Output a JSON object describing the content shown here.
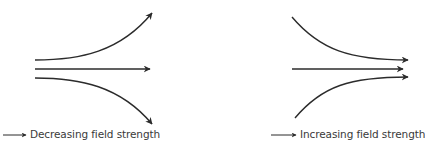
{
  "diagrams": [
    {
      "name": "diverging-field-lines",
      "legend_label": "Decreasing field strength",
      "line_color": "#2b2b2b"
    },
    {
      "name": "converging-field-lines",
      "legend_label": "Increasing field strength",
      "line_color": "#2b2b2b"
    }
  ],
  "legend_arrow_icon": "right-arrow-icon"
}
